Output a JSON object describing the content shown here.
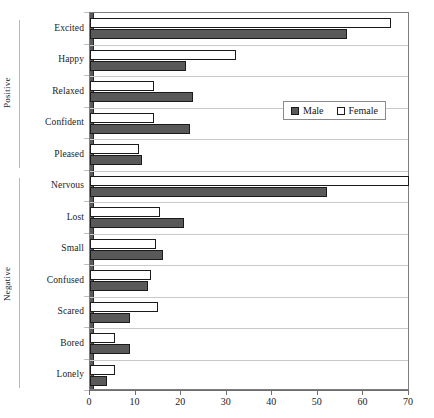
{
  "chart_data": {
    "type": "bar",
    "orientation": "horizontal",
    "title": "",
    "subtitle": "",
    "xlabel": "",
    "ylabel": "",
    "xlim": [
      0,
      70
    ],
    "xticks": [
      0,
      10,
      20,
      30,
      40,
      50,
      60,
      70
    ],
    "xtick_labels": [
      "0",
      "10",
      "20",
      "30",
      "40",
      "50",
      "60",
      "70"
    ],
    "grid": false,
    "legend_position": "center-right",
    "categories": [
      "Excited",
      "Happy",
      "Relaxed",
      "Confident",
      "Pleased",
      "Nervous",
      "Lost",
      "Small",
      "Confused",
      "Scared",
      "Bored",
      "Lonely"
    ],
    "group_labels": [
      "Positive",
      "Negative"
    ],
    "groups": [
      {
        "label": "Positive",
        "categories": [
          "Excited",
          "Happy",
          "Relaxed",
          "Confident",
          "Pleased"
        ]
      },
      {
        "label": "Negative",
        "categories": [
          "Nervous",
          "Lost",
          "Small",
          "Confused",
          "Scared",
          "Bored",
          "Lonely"
        ]
      }
    ],
    "series": [
      {
        "name": "Male",
        "color": "#595959",
        "values": [
          56.5,
          21,
          22.5,
          22,
          11.5,
          52,
          20.7,
          16,
          12.8,
          8.8,
          8.8,
          3.8
        ]
      },
      {
        "name": "Female",
        "color": "#ffffff",
        "values": [
          66,
          32,
          14,
          14,
          10.8,
          70,
          15.3,
          14.5,
          13.3,
          15,
          5.5,
          5.5
        ]
      }
    ]
  },
  "legend": {
    "items": [
      {
        "label": "Male",
        "swatch": "male-swatch"
      },
      {
        "label": "Female",
        "swatch": "female-swatch"
      }
    ]
  },
  "colors": {
    "male": "#595959",
    "female": "#ffffff",
    "outline": "#1b1b1b",
    "axis": "#6e6e6e",
    "separator": "#c9c9c9",
    "text": "#1c1c1c"
  }
}
